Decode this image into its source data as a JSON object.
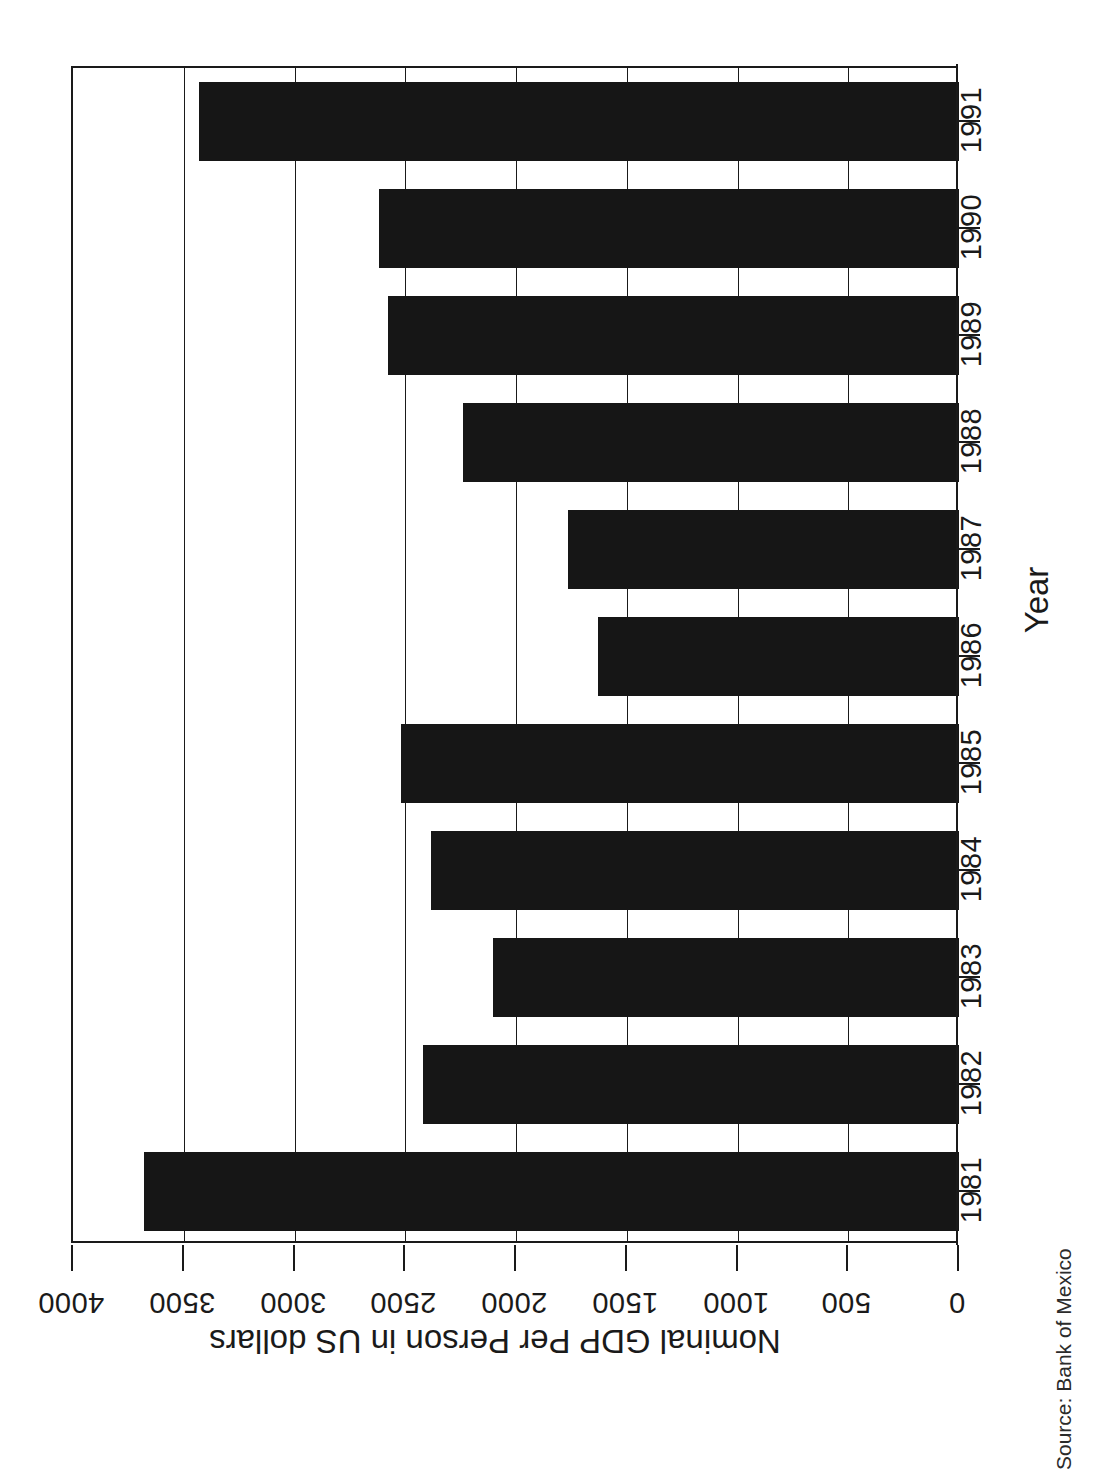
{
  "chart_data": {
    "type": "bar",
    "orientation": "rotated-90",
    "title": "",
    "subtitle": "",
    "xlabel": "Year",
    "ylabel": "Nominal GDP Per Person in US dollars",
    "categories": [
      "1981",
      "1982",
      "1983",
      "1984",
      "1985",
      "1986",
      "1987",
      "1988",
      "1989",
      "1990",
      "1991"
    ],
    "values": [
      3680,
      2420,
      2105,
      2385,
      2520,
      1630,
      1765,
      2240,
      2580,
      2620,
      3430
    ],
    "series": [
      {
        "name": "Nominal GDP Per Person in US dollars",
        "values": [
          3680,
          2420,
          2105,
          2385,
          2520,
          1630,
          1765,
          2240,
          2580,
          2620,
          3430
        ]
      }
    ],
    "ylim": [
      0,
      4000
    ],
    "ytick_labels": [
      "0",
      "500",
      "1000",
      "1500",
      "2000",
      "2500",
      "3000",
      "3500",
      "4000"
    ],
    "ytick_values": [
      0,
      500,
      1000,
      1500,
      2000,
      2500,
      3000,
      3500,
      4000
    ],
    "grid": true,
    "grid_axis": "value",
    "legend": false,
    "legend_position": "none",
    "bar_color": "#161616",
    "axis_color": "#1a1a1a",
    "background_color": "#ffffff"
  },
  "axes": {
    "value_axis_title": "Nominal GDP Per Person in US dollars",
    "category_axis_title": "Year",
    "value_ticks": [
      {
        "label": "4000",
        "value": 4000
      },
      {
        "label": "3500",
        "value": 3500
      },
      {
        "label": "3000",
        "value": 3000
      },
      {
        "label": "2500",
        "value": 2500
      },
      {
        "label": "2000",
        "value": 2000
      },
      {
        "label": "1500",
        "value": 1500
      },
      {
        "label": "1000",
        "value": 1000
      },
      {
        "label": "500",
        "value": 500
      },
      {
        "label": "0",
        "value": 0
      }
    ],
    "category_ticks": [
      {
        "label": "1991",
        "value": 3430
      },
      {
        "label": "1990",
        "value": 2620
      },
      {
        "label": "1989",
        "value": 2580
      },
      {
        "label": "1988",
        "value": 2240
      },
      {
        "label": "1987",
        "value": 1765
      },
      {
        "label": "1986",
        "value": 1630
      },
      {
        "label": "1985",
        "value": 2520
      },
      {
        "label": "1984",
        "value": 2385
      },
      {
        "label": "1983",
        "value": 2105
      },
      {
        "label": "1982",
        "value": 2420
      },
      {
        "label": "1981",
        "value": 3680
      }
    ]
  },
  "footer": {
    "source": "Source: Bank of Mexico"
  }
}
